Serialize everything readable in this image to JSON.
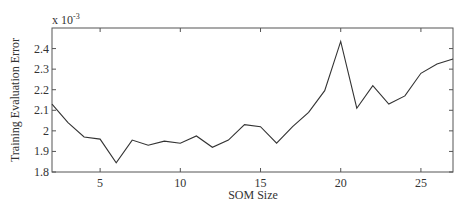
{
  "chart_data": {
    "type": "line",
    "title": "",
    "xlabel": "SOM Size",
    "ylabel": "Training Evaluation Error",
    "y_exponent_label": "x 10",
    "y_exponent_power": "-3",
    "xlim": [
      2,
      27
    ],
    "ylim": [
      1.8,
      2.5
    ],
    "xticks": [
      5,
      10,
      15,
      20,
      25
    ],
    "yticks": [
      1.8,
      1.9,
      2.0,
      2.1,
      2.2,
      2.3,
      2.4
    ],
    "ytick_labels": [
      "1.8",
      "1.9",
      "2",
      "2.1",
      "2.2",
      "2.3",
      "2.4"
    ],
    "grid": false,
    "legend": null,
    "series": [
      {
        "name": "Training Evaluation Error",
        "color": "#333333",
        "x": [
          2,
          3,
          4,
          5,
          6,
          7,
          8,
          9,
          10,
          11,
          12,
          13,
          14,
          15,
          16,
          17,
          18,
          19,
          20,
          21,
          22,
          23,
          24,
          25,
          26,
          27
        ],
        "values": [
          2.13,
          2.04,
          1.97,
          1.96,
          1.845,
          1.955,
          1.93,
          1.95,
          1.94,
          1.975,
          1.92,
          1.955,
          2.03,
          2.02,
          1.94,
          2.02,
          2.09,
          2.195,
          2.435,
          2.11,
          2.22,
          2.13,
          2.17,
          2.28,
          2.325,
          2.35
        ]
      }
    ]
  }
}
